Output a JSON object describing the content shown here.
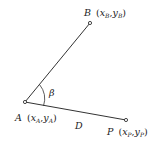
{
  "diagram": {
    "type": "geometry",
    "colors": {
      "stroke": "#333333",
      "text": "#222222",
      "background": "#ffffff"
    },
    "points": {
      "A": {
        "name": "A",
        "coords_label": "(x_A, y_A)",
        "sub": "A",
        "x": 25,
        "y": 102
      },
      "B": {
        "name": "B",
        "coords_label": "(x_B, y_B)",
        "sub": "B",
        "x": 90,
        "y": 23
      },
      "P": {
        "name": "P",
        "coords_label": "(x_P, y_P)",
        "sub": "P",
        "x": 126,
        "y": 120
      }
    },
    "segments": [
      {
        "from": "A",
        "to": "B"
      },
      {
        "from": "A",
        "to": "P",
        "label": "D"
      }
    ],
    "angle": {
      "vertex": "A",
      "label": "β"
    },
    "labels": {
      "A_name": "A",
      "A_x": "x",
      "A_sub": "A",
      "A_y": "y",
      "A_sub2": "A",
      "B_name": "B",
      "B_x": "x",
      "B_sub": "B",
      "B_y": "y",
      "B_sub2": "B",
      "P_name": "P",
      "P_x": "x",
      "P_sub": "P",
      "P_y": "y",
      "P_sub2": "P",
      "distance": "D",
      "angle": "β"
    }
  }
}
